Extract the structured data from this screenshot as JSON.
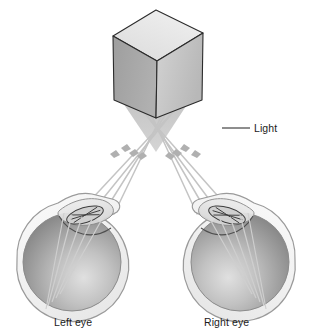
{
  "figure": {
    "background_color": "#ffffff"
  },
  "labels": {
    "light": "Light",
    "left_eye": "Left eye",
    "right_eye": "Right eye"
  },
  "object": {
    "name": "cube",
    "top_face_color": "#e4e4e4",
    "left_face_color": "#a6a6a6",
    "right_face_color": "#c6c6c6",
    "outline_color": "#2b2b2b"
  },
  "light_cone": {
    "name": "light-cone",
    "color": "#c9c9c9"
  },
  "rays": {
    "color": "#c4c4c4",
    "arrow_color": "#b4b4b4",
    "count_per_eye": 4
  },
  "eyes": [
    {
      "side": "left",
      "label": "Left eye",
      "sclera_color": "#f2f2f2",
      "outline_color": "#8e8e8e",
      "vitreous_light": "#d9d9d9",
      "vitreous_dark": "#8d8d8d",
      "cornea_color": "#e6e6e6",
      "lens_color": "#4a4a4a"
    },
    {
      "side": "right",
      "label": "Right eye",
      "sclera_color": "#f2f2f2",
      "outline_color": "#8e8e8e",
      "vitreous_light": "#d9d9d9",
      "vitreous_dark": "#8d8d8d",
      "cornea_color": "#e6e6e6",
      "lens_color": "#4a4a4a"
    }
  ],
  "leader_line": {
    "name": "light-leader-line",
    "color": "#1c1c1c"
  }
}
